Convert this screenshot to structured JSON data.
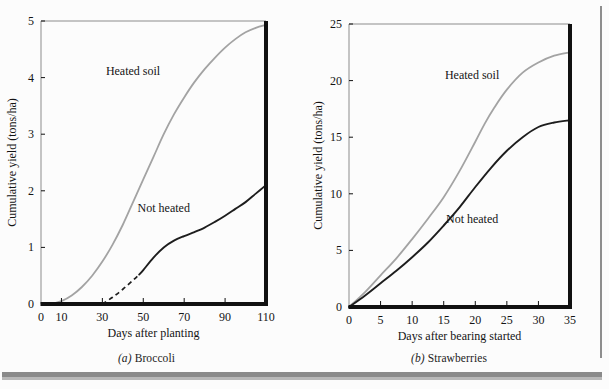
{
  "page": {
    "background_color": "#fcfcfc",
    "edge_color": "#8a8a8a"
  },
  "colors": {
    "heated": "#a3a3a3",
    "not_heated": "#1d1d1d",
    "axis": "#111111",
    "frame": "#8c8c8c",
    "text": "#141414"
  },
  "figures": [
    {
      "id": "broccoli",
      "caption_prefix": "(a)",
      "caption_text": "Broccoli"
    },
    {
      "id": "strawberries",
      "caption_prefix": "(b)",
      "caption_text": "Strawberries"
    }
  ],
  "chart_data": [
    {
      "type": "line",
      "title": "(a) Broccoli",
      "xlabel": "Days after planting",
      "ylabel": "Cumulative yield (tons/ha)",
      "xlim": [
        0,
        110
      ],
      "ylim": [
        0,
        5
      ],
      "xticks": [
        0,
        10,
        30,
        50,
        70,
        90,
        110
      ],
      "xtick_labels": [
        "0",
        "10",
        "30",
        "50",
        "70",
        "90",
        "110"
      ],
      "yticks": [
        0,
        1,
        2,
        3,
        4,
        5
      ],
      "ytick_labels": [
        "0",
        "1",
        "2",
        "3",
        "4",
        "5"
      ],
      "grid": false,
      "legend": "inline-annotations",
      "annotations": [
        {
          "text": "Heated soil",
          "x": 45,
          "y": 4.05
        },
        {
          "text": "Not heated",
          "x": 60,
          "y": 1.62
        }
      ],
      "series": [
        {
          "name": "Heated soil",
          "style": "solid",
          "color": "#a3a3a3",
          "x": [
            5,
            10,
            15,
            20,
            25,
            30,
            35,
            40,
            45,
            50,
            55,
            60,
            65,
            70,
            75,
            80,
            85,
            90,
            95,
            100,
            105,
            110
          ],
          "y": [
            0.0,
            0.05,
            0.15,
            0.3,
            0.5,
            0.75,
            1.05,
            1.4,
            1.8,
            2.2,
            2.6,
            3.0,
            3.35,
            3.65,
            3.92,
            4.15,
            4.35,
            4.53,
            4.68,
            4.8,
            4.88,
            4.93
          ]
        },
        {
          "name": "Not heated",
          "style": "solid-with-dashed-start",
          "color": "#1d1d1d",
          "dashed_segment_x": [
            30,
            48
          ],
          "x": [
            30,
            35,
            40,
            45,
            48,
            50,
            55,
            60,
            65,
            70,
            75,
            80,
            85,
            90,
            95,
            100,
            105,
            110
          ],
          "y": [
            0.0,
            0.12,
            0.26,
            0.42,
            0.52,
            0.6,
            0.82,
            1.0,
            1.12,
            1.2,
            1.27,
            1.35,
            1.45,
            1.56,
            1.68,
            1.8,
            1.95,
            2.1
          ]
        }
      ]
    },
    {
      "type": "line",
      "title": "(b) Strawberries",
      "xlabel": "Days after bearing started",
      "ylabel": "Cumulative yield (tons/ha)",
      "xlim": [
        0,
        35
      ],
      "ylim": [
        0,
        25
      ],
      "xticks": [
        0,
        5,
        10,
        15,
        20,
        25,
        30,
        35
      ],
      "xtick_labels": [
        "0",
        "5",
        "10",
        "15",
        "20",
        "25",
        "30",
        "35"
      ],
      "yticks": [
        0,
        5,
        10,
        15,
        20,
        25
      ],
      "ytick_labels": [
        "0",
        "5",
        "10",
        "15",
        "20",
        "25"
      ],
      "grid": false,
      "legend": "inline-annotations",
      "annotations": [
        {
          "text": "Heated soil",
          "x": 19.5,
          "y": 20.1
        },
        {
          "text": "Not heated",
          "x": 19.5,
          "y": 7.4
        }
      ],
      "series": [
        {
          "name": "Heated soil",
          "style": "solid",
          "color": "#a3a3a3",
          "x": [
            0,
            2.5,
            5,
            7.5,
            10,
            12.5,
            15,
            17.5,
            20,
            21.5,
            23,
            25,
            27.5,
            30,
            32.5,
            35
          ],
          "y": [
            0.0,
            1.3,
            2.8,
            4.3,
            6.0,
            7.8,
            9.7,
            12.0,
            14.6,
            16.2,
            17.6,
            19.2,
            20.7,
            21.6,
            22.2,
            22.5
          ]
        },
        {
          "name": "Not heated",
          "style": "solid",
          "color": "#1d1d1d",
          "x": [
            0,
            2.5,
            5,
            7.5,
            10,
            12.5,
            15,
            17.5,
            20,
            22.5,
            25,
            27.5,
            30,
            32.5,
            35
          ],
          "y": [
            0.0,
            1.0,
            2.1,
            3.2,
            4.4,
            5.7,
            7.2,
            8.8,
            10.6,
            12.3,
            13.8,
            15.0,
            15.9,
            16.3,
            16.5
          ]
        }
      ]
    }
  ]
}
